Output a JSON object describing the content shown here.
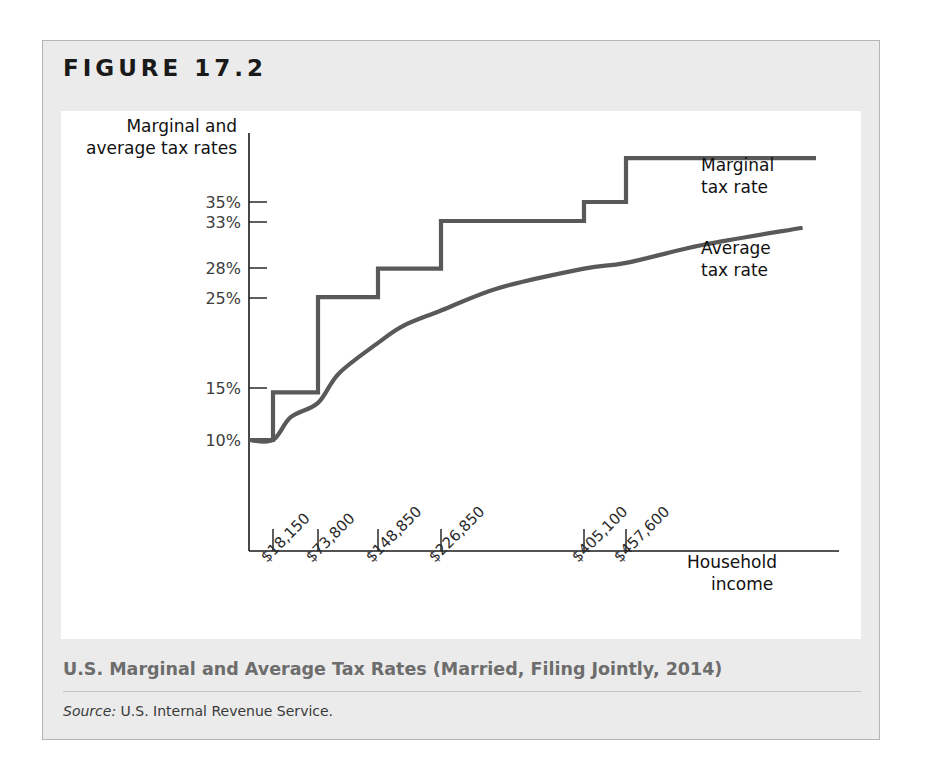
{
  "figure": {
    "label": "FIGURE 17.2",
    "caption": "U.S. Marginal and Average Tax Rates (Married, Filing Jointly, 2014)",
    "source_label": "Source:",
    "source_text": " U.S. Internal Revenue Service."
  },
  "chart_data": {
    "type": "line",
    "title": "U.S. Marginal and Average Tax Rates (Married, Filing Jointly, 2014)",
    "xlabel": "Household income",
    "ylabel": "Marginal and average tax rates",
    "ylabel_line1": "Marginal and",
    "ylabel_line2": "average tax rates",
    "xlabel_line1": "Household",
    "xlabel_line2": "income",
    "grid": false,
    "legend_position": "inline-right",
    "ytick_labels": [
      "35%",
      "33%",
      "28%",
      "25%",
      "15%",
      "10%"
    ],
    "ytick_values": [
      35,
      33,
      28,
      25,
      15,
      10
    ],
    "xtick_labels": [
      "$18,150",
      "$73,800",
      "$148,850",
      "$226,850",
      "$405,100",
      "$457,600"
    ],
    "xtick_values": [
      18150,
      73800,
      148850,
      226850,
      405100,
      457600
    ],
    "series": [
      {
        "name": "Marginal tax rate",
        "label_line1": "Marginal",
        "label_line2": "tax rate",
        "style": "step",
        "color": "#595959",
        "brackets": [
          {
            "lower": 0,
            "upper": 18150,
            "rate": 10
          },
          {
            "lower": 18150,
            "upper": 73800,
            "rate": 15
          },
          {
            "lower": 73800,
            "upper": 148850,
            "rate": 25
          },
          {
            "lower": 148850,
            "upper": 226850,
            "rate": 28
          },
          {
            "lower": 226850,
            "upper": 405100,
            "rate": 33
          },
          {
            "lower": 405100,
            "upper": 457600,
            "rate": 35
          },
          {
            "lower": 457600,
            "upper": 600000,
            "rate": 39.6
          }
        ]
      },
      {
        "name": "Average tax rate",
        "label_line1": "Average",
        "label_line2": "tax rate",
        "style": "smooth",
        "color": "#595959",
        "x": [
          0,
          18150,
          40000,
          73800,
          100000,
          148850,
          180000,
          226850,
          300000,
          405100,
          457600,
          520000,
          600000
        ],
        "y": [
          10.0,
          10.0,
          12.4,
          13.9,
          17.0,
          20.2,
          22.0,
          23.6,
          26.0,
          28.0,
          28.6,
          30.5,
          32.3
        ]
      }
    ],
    "ylim": [
      0,
      42
    ],
    "xlim": [
      0,
      600000
    ]
  }
}
